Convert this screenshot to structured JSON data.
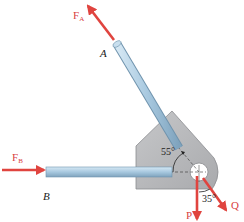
{
  "diagram": {
    "type": "statics free-body / bracket with two members",
    "forces": [
      {
        "id": "FA",
        "label": "F",
        "subscript": "A",
        "direction": "along member A, pointing up-left"
      },
      {
        "id": "FB",
        "label": "F",
        "subscript": "B",
        "direction": "horizontal, pointing right into member B"
      },
      {
        "id": "P",
        "label": "P",
        "direction": "vertically downward"
      },
      {
        "id": "Q",
        "label": "Q",
        "direction": "down-right, 35° from vertical"
      }
    ],
    "points": [
      {
        "id": "A",
        "label": "A"
      },
      {
        "id": "B",
        "label": "B"
      }
    ],
    "angles": [
      {
        "label": "55°",
        "between": "member A and horizontal"
      },
      {
        "label": "35°",
        "between": "P and Q"
      }
    ],
    "colors": {
      "force": "#e0443f",
      "rod": "#a9cbe3",
      "rod_edge": "#6f93ad",
      "plate": "#b9babc",
      "plate_edge": "#8c8d90"
    }
  }
}
